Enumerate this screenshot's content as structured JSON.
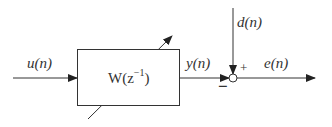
{
  "diagram": {
    "type": "adaptive-filter-block-diagram",
    "signals": {
      "input": "u(n)",
      "output": "y(n)",
      "desired": "d(n)",
      "error": "e(n)"
    },
    "block": {
      "label": "W(z",
      "exponent": "−1",
      "close": ")"
    },
    "junction": {
      "plus_sign": "+",
      "minus_sign": "−"
    }
  }
}
